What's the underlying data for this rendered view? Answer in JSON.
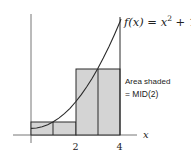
{
  "diagram": {
    "function_label": "f(x) = x² + 1",
    "function_label_parts": {
      "f": "f(x) = x",
      "exp": "2",
      "rest": " + 1"
    },
    "annotation_line1": "Area shaded",
    "annotation_line2": "= MID(2)",
    "x_axis_label": "x",
    "x_ticks": [
      {
        "value": 2,
        "label": "2"
      },
      {
        "value": 4,
        "label": "4"
      }
    ],
    "rectangles": [
      {
        "x_start": 0,
        "x_end": 2,
        "midpoint": 1,
        "height": 2
      },
      {
        "x_start": 2,
        "x_end": 4,
        "midpoint": 3,
        "height": 10
      }
    ],
    "colors": {
      "fill": "#d4d4d4",
      "stroke": "#2a2a2a",
      "background": "#ffffff"
    }
  }
}
